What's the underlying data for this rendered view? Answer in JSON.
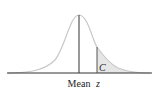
{
  "diagram": {
    "type": "normal-distribution",
    "labels": {
      "mean": "Mean",
      "z": "z",
      "area": "C"
    },
    "colors": {
      "curve": "#c8c8c8",
      "axis": "#333333",
      "shade": "#e6e6e6",
      "marker": "#333333"
    }
  }
}
